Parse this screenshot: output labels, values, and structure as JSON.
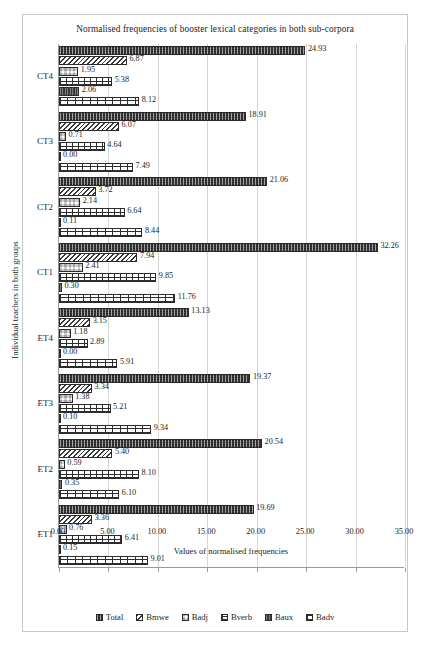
{
  "chart_data": {
    "type": "bar",
    "orientation": "horizontal",
    "title": "Normalised frequencies of booster lexical categories in both sub-corpora",
    "xlabel": "Values of normalised frequencies",
    "ylabel": "Individual teachers in both groups",
    "xlim": [
      0,
      35
    ],
    "xticks": [
      "0.00",
      "5.00",
      "10.00",
      "15.00",
      "20.00",
      "25.00",
      "30.00",
      "35.00"
    ],
    "xtick_values": [
      0,
      5,
      10,
      15,
      20,
      25,
      30,
      35
    ],
    "grid": "vertical",
    "legend_position": "bottom",
    "categories": [
      "ET1",
      "ET2",
      "ET3",
      "ET4",
      "CT1",
      "CT2",
      "CT3",
      "CT4"
    ],
    "series": [
      {
        "name": "Total",
        "pattern": "p-total",
        "values": [
          19.69,
          20.54,
          19.37,
          13.13,
          32.26,
          21.06,
          18.91,
          24.93
        ]
      },
      {
        "name": "Bmwe",
        "pattern": "p-bmwe",
        "values": [
          3.36,
          5.4,
          3.34,
          3.15,
          7.94,
          3.72,
          6.07,
          6.87
        ]
      },
      {
        "name": "Badj",
        "pattern": "p-badj",
        "values": [
          0.76,
          0.59,
          1.38,
          1.18,
          2.41,
          2.14,
          0.71,
          1.95
        ]
      },
      {
        "name": "Bverb",
        "pattern": "p-bverb",
        "values": [
          6.41,
          8.1,
          5.21,
          2.89,
          9.85,
          6.64,
          4.64,
          5.38
        ]
      },
      {
        "name": "Baux",
        "pattern": "p-baux",
        "values": [
          0.15,
          0.35,
          0.1,
          0.0,
          0.3,
          0.11,
          0.0,
          2.06
        ]
      },
      {
        "name": "Badv",
        "pattern": "p-badv",
        "values": [
          9.01,
          6.1,
          9.34,
          5.91,
          11.76,
          8.44,
          7.49,
          8.12
        ]
      }
    ],
    "data_labels": {
      "CT4": {
        "Total": "24.93",
        "Bmwe": "6.87",
        "Badj": "1.95",
        "Bverb": "5.38",
        "Baux": "2.06",
        "Badv": "8.12"
      },
      "CT3": {
        "Total": "18.91",
        "Bmwe": "6.07",
        "Badj": "0.71",
        "Bverb": "4.64",
        "Baux": "0.00",
        "Badv": "7.49"
      },
      "CT2": {
        "Total": "21.06",
        "Bmwe": "3.72",
        "Badj": "2.14",
        "Bverb": "6.64",
        "Baux": "0.11",
        "Badv": "8.44"
      },
      "CT1": {
        "Total": "32.26",
        "Bmwe": "7.94",
        "Badj": "2.41",
        "Bverb": "9.85",
        "Baux": "0.30",
        "Badv": "11.76"
      },
      "ET4": {
        "Total": "13.13",
        "Bmwe": "3.15",
        "Badj": "1.18",
        "Bverb": "2.89",
        "Baux": "0.00",
        "Badv": "5.91"
      },
      "ET3": {
        "Total": "19.37",
        "Bmwe": "3.34",
        "Badj": "1.38",
        "Bverb": "5.21",
        "Baux": "0.10",
        "Badv": "9.34"
      },
      "ET2": {
        "Total": "20.54",
        "Bmwe": "5.40",
        "Badj": "0.59",
        "Bverb": "8.10",
        "Baux": "0.35",
        "Badv": "6.10"
      },
      "ET1": {
        "Total": "19.69",
        "Bmwe": "3.36",
        "Badj": "0.76",
        "Bverb": "6.41",
        "Baux": "0.15",
        "Badv": "9.01"
      }
    },
    "legend": [
      "Total",
      "Bmwe",
      "Badj",
      "Bverb",
      "Baux",
      "Badv"
    ]
  }
}
